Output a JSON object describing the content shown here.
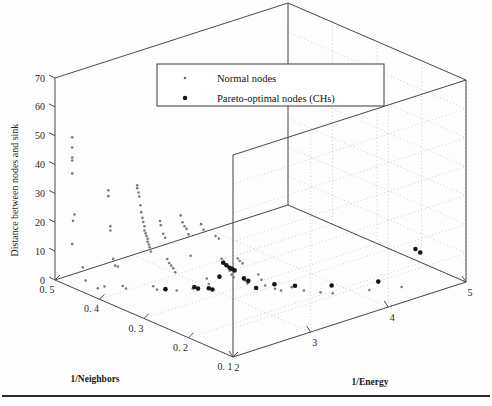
{
  "figure": {
    "background_color": "#fdfdfd",
    "axis_color": "#4a4a4a",
    "grid_color": "#b9b9b9",
    "normal_node_color": "#8c8c8c",
    "pareto_node_color": "#1a1a1a"
  },
  "legend": {
    "entries": [
      {
        "label": "Normal nodes",
        "marker": "small-dot-marker",
        "size": 1.3,
        "color": "#6f6f6f"
      },
      {
        "label": "Pareto-optimal nodes (CHs)",
        "marker": "large-dot-marker",
        "size": 2.2,
        "color": "#151515"
      }
    ]
  },
  "chart_data": {
    "type": "scatter",
    "projection": "3d",
    "title": "",
    "xlabel": "1/Neighbors",
    "ylabel": "1/Energy",
    "zlabel": "Distance between nodes and sink",
    "xlim": [
      0.5,
      0.1
    ],
    "ylim": [
      2,
      5
    ],
    "zlim": [
      0,
      70
    ],
    "xticks": [
      0.5,
      0.4,
      0.3,
      0.2,
      0.1
    ],
    "xticklabels": [
      "0. 5",
      "0. 4",
      "0. 3",
      "0. 2",
      "0. 1"
    ],
    "yticks": [
      2,
      3,
      4,
      5
    ],
    "yticklabels": [
      "2",
      "3",
      "4",
      "5"
    ],
    "zticks": [
      0,
      10,
      20,
      30,
      40,
      50,
      60,
      70
    ],
    "zticklabels": [
      "0",
      "10",
      "20",
      "30",
      "40",
      "50",
      "60",
      "70"
    ],
    "grid": true,
    "legend_position": "upper-center",
    "series": [
      {
        "name": "Normal nodes",
        "marker_size": 1.3,
        "color": "#7a7a7a",
        "points": [
          [
            0.47,
            2.05,
            51.0
          ],
          [
            0.47,
            2.05,
            47.5
          ],
          [
            0.47,
            2.05,
            44.0
          ],
          [
            0.47,
            2.05,
            43.0
          ],
          [
            0.47,
            2.05,
            38.5
          ],
          [
            0.47,
            2.08,
            24.0
          ],
          [
            0.47,
            2.06,
            22.0
          ],
          [
            0.47,
            2.05,
            14.0
          ],
          [
            0.455,
            2.1,
            6.5
          ],
          [
            0.452,
            2.12,
            2.0
          ],
          [
            0.415,
            2.2,
            35.0
          ],
          [
            0.415,
            2.2,
            33.0
          ],
          [
            0.414,
            2.22,
            22.5
          ],
          [
            0.414,
            2.22,
            21.0
          ],
          [
            0.413,
            2.25,
            11.0
          ],
          [
            0.412,
            2.27,
            8.5
          ],
          [
            0.411,
            2.3,
            8.0
          ],
          [
            0.4,
            2.3,
            2.0
          ],
          [
            0.398,
            2.33,
            1.0
          ],
          [
            0.385,
            2.4,
            37.0
          ],
          [
            0.385,
            2.4,
            36.0
          ],
          [
            0.384,
            2.41,
            34.5
          ],
          [
            0.384,
            2.42,
            33.0
          ],
          [
            0.383,
            2.43,
            30.0
          ],
          [
            0.383,
            2.44,
            27.5
          ],
          [
            0.382,
            2.45,
            25.5
          ],
          [
            0.382,
            2.46,
            24.0
          ],
          [
            0.381,
            2.47,
            22.5
          ],
          [
            0.381,
            2.47,
            21.0
          ],
          [
            0.38,
            2.48,
            20.0
          ],
          [
            0.38,
            2.49,
            19.0
          ],
          [
            0.379,
            2.5,
            18.0
          ],
          [
            0.379,
            2.5,
            17.0
          ],
          [
            0.378,
            2.51,
            16.0
          ],
          [
            0.378,
            2.52,
            15.0
          ],
          [
            0.377,
            2.53,
            13.5
          ],
          [
            0.36,
            2.55,
            25.0
          ],
          [
            0.36,
            2.56,
            23.5
          ],
          [
            0.358,
            2.58,
            20.5
          ],
          [
            0.357,
            2.6,
            19.0
          ],
          [
            0.356,
            2.62,
            11.5
          ],
          [
            0.355,
            2.64,
            10.0
          ],
          [
            0.354,
            2.66,
            9.0
          ],
          [
            0.353,
            2.68,
            8.0
          ],
          [
            0.352,
            2.7,
            6.5
          ],
          [
            0.34,
            2.7,
            27.0
          ],
          [
            0.339,
            2.72,
            24.5
          ],
          [
            0.338,
            2.74,
            23.0
          ],
          [
            0.337,
            2.76,
            22.0
          ],
          [
            0.336,
            2.78,
            20.0
          ],
          [
            0.335,
            2.8,
            12.5
          ],
          [
            0.32,
            2.85,
            24.0
          ],
          [
            0.318,
            2.87,
            22.0
          ],
          [
            0.316,
            2.9,
            5.0
          ],
          [
            0.315,
            2.92,
            3.0
          ],
          [
            0.305,
            2.95,
            20.0
          ],
          [
            0.303,
            2.98,
            19.0
          ],
          [
            0.3,
            3.0,
            12.0
          ],
          [
            0.299,
            3.02,
            11.0
          ],
          [
            0.298,
            3.04,
            10.0
          ],
          [
            0.297,
            3.06,
            9.0
          ],
          [
            0.296,
            3.08,
            7.5
          ],
          [
            0.295,
            3.1,
            6.0
          ],
          [
            0.294,
            3.12,
            5.0
          ],
          [
            0.29,
            3.15,
            11.5
          ],
          [
            0.289,
            3.17,
            10.5
          ],
          [
            0.288,
            3.2,
            9.5
          ],
          [
            0.285,
            3.22,
            3.5
          ],
          [
            0.284,
            3.24,
            2.5
          ],
          [
            0.27,
            3.3,
            6.0
          ],
          [
            0.268,
            3.33,
            4.0
          ],
          [
            0.265,
            3.36,
            2.0
          ],
          [
            0.25,
            3.4,
            1.5
          ],
          [
            0.245,
            3.45,
            0.8
          ],
          [
            0.23,
            3.5,
            2.5
          ],
          [
            0.22,
            3.6,
            1.2
          ],
          [
            0.2,
            3.7,
            1.0
          ],
          [
            0.19,
            3.8,
            0.5
          ],
          [
            0.43,
            2.15,
            0.5
          ],
          [
            0.42,
            2.18,
            1.5
          ],
          [
            0.37,
            2.52,
            2.0
          ],
          [
            0.365,
            2.54,
            1.0
          ],
          [
            0.345,
            2.68,
            0.8
          ],
          [
            0.33,
            2.8,
            1.5
          ],
          [
            0.16,
            4.1,
            1.0
          ],
          [
            0.14,
            4.4,
            0.8
          ]
        ]
      },
      {
        "name": "Pareto-optimal nodes (CHs)",
        "marker_size": 2.3,
        "color": "#151515",
        "points": [
          [
            0.3,
            3.02,
            10.5
          ],
          [
            0.298,
            3.05,
            9.5
          ],
          [
            0.296,
            3.08,
            8.5
          ],
          [
            0.294,
            3.1,
            8.0
          ],
          [
            0.292,
            3.12,
            7.5
          ],
          [
            0.315,
            2.92,
            1.5
          ],
          [
            0.312,
            2.95,
            1.0
          ],
          [
            0.33,
            2.82,
            1.8
          ],
          [
            0.327,
            2.85,
            1.2
          ],
          [
            0.285,
            3.2,
            4.5
          ],
          [
            0.282,
            3.24,
            3.5
          ],
          [
            0.275,
            3.3,
            1.0
          ],
          [
            0.26,
            3.45,
            2.0
          ],
          [
            0.24,
            3.6,
            1.5
          ],
          [
            0.21,
            3.9,
            1.0
          ],
          [
            0.175,
            4.3,
            1.2
          ],
          [
            0.135,
            4.55,
            13.0
          ],
          [
            0.133,
            4.6,
            11.5
          ],
          [
            0.36,
            2.62,
            0.8
          ],
          [
            0.305,
            3.0,
            5.5
          ]
        ]
      }
    ]
  },
  "axis_titles": {
    "x": "1/Neighbors",
    "y": "1/Energy",
    "z": "Distance between nodes and sink"
  }
}
